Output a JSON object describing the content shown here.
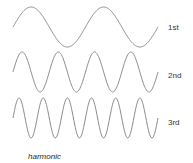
{
  "diagram": {
    "caption": "harmonic",
    "line_color": "#8a8a8a",
    "x_start": 13,
    "x_end": 158,
    "amplitude": 20,
    "waves": [
      {
        "label": "1st",
        "cycles": 2,
        "center_y": 27,
        "label_x": 168,
        "label_y": 24
      },
      {
        "label": "2nd",
        "cycles": 4,
        "center_y": 72,
        "label_x": 168,
        "label_y": 72
      },
      {
        "label": "3rd",
        "cycles": 6,
        "center_y": 118,
        "label_x": 168,
        "label_y": 119
      }
    ]
  }
}
